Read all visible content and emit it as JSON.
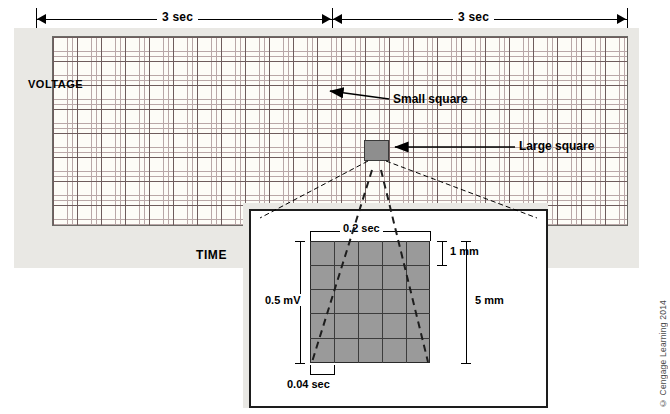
{
  "diagram": {
    "top_measure": {
      "left_label": "3 sec",
      "right_label": "3 sec"
    },
    "axes": {
      "voltage_label": "VOLTAGE",
      "time_label": "TIME"
    },
    "callouts": {
      "small_square": "Small square",
      "large_square": "Large square"
    },
    "inset": {
      "top_label": "0.2 sec",
      "bottom_label": "0.04 sec",
      "left_label": "0.5 mV",
      "right_top_label": "1 mm",
      "right_bottom_label": "5 mm"
    },
    "credit": "© Cengage Learning 2014"
  }
}
